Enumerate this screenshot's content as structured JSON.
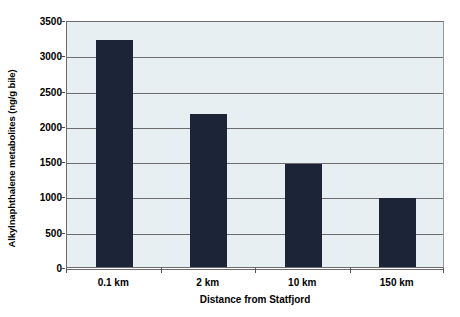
{
  "chart_data": {
    "type": "bar",
    "title": "",
    "subtitle": "",
    "xlabel": "Distance from Statfjord",
    "ylabel": "Alkylnaphthalene metabolites (ng/g bile)",
    "categories": [
      "0.1 km",
      "2 km",
      "10 km",
      "150 km"
    ],
    "values": [
      3210,
      2170,
      1455,
      980
    ],
    "series": [
      {
        "name": "Alkylnaphthalene metabolites",
        "values": [
          3210,
          2170,
          1455,
          980
        ]
      }
    ],
    "ylim": [
      0,
      3500
    ],
    "yticks": [
      0,
      500,
      1000,
      1500,
      2000,
      2500,
      3000,
      3500
    ],
    "ytick_labels": [
      "0",
      "500",
      "1000",
      "1500",
      "2000",
      "2500",
      "3000",
      "3500"
    ],
    "grid": true,
    "grid_axis": "y",
    "legend": false,
    "legend_position": "none",
    "bar_color": "#1c2438",
    "plot_background": "#e8eff2",
    "gridline_color": "#6c6c6c",
    "figure_background": "#ffffff"
  }
}
